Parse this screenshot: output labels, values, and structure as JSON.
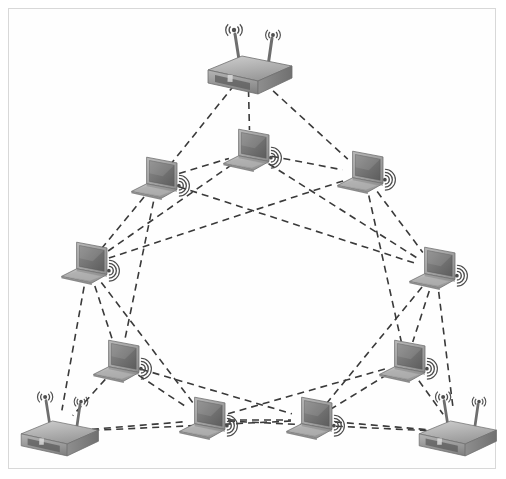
{
  "figure": {
    "width": 506,
    "height": 479,
    "background_color": "#ffffff",
    "border_color": "#d8d8d8",
    "link_color": "#3a3a3a",
    "link_style": "dashed",
    "link_dash": "7,5",
    "link_width": 1.6
  },
  "nodes": [
    {
      "id": "router-top",
      "type": "router",
      "label": "wireless-router",
      "x": 248,
      "y": 68,
      "scale": 1.0,
      "antennas": 2,
      "signal_icon": false
    },
    {
      "id": "laptop-upper-left",
      "type": "laptop",
      "label": "laptop",
      "x": 158,
      "y": 180,
      "scale": 0.95,
      "antennas": 0,
      "signal_icon": true
    },
    {
      "id": "laptop-upper-center",
      "type": "laptop",
      "label": "laptop",
      "x": 250,
      "y": 152,
      "scale": 0.95,
      "antennas": 0,
      "signal_icon": true
    },
    {
      "id": "laptop-upper-right",
      "type": "laptop",
      "label": "laptop",
      "x": 364,
      "y": 174,
      "scale": 0.95,
      "antennas": 0,
      "signal_icon": true
    },
    {
      "id": "laptop-left",
      "type": "laptop",
      "label": "laptop",
      "x": 88,
      "y": 265,
      "scale": 0.95,
      "antennas": 0,
      "signal_icon": true
    },
    {
      "id": "laptop-right",
      "type": "laptop",
      "label": "laptop",
      "x": 436,
      "y": 270,
      "scale": 0.95,
      "antennas": 0,
      "signal_icon": true
    },
    {
      "id": "laptop-lower-left",
      "type": "laptop",
      "label": "laptop",
      "x": 120,
      "y": 363,
      "scale": 0.95,
      "antennas": 0,
      "signal_icon": true
    },
    {
      "id": "laptop-lower-right",
      "type": "laptop",
      "label": "laptop",
      "x": 406,
      "y": 363,
      "scale": 0.95,
      "antennas": 0,
      "signal_icon": true
    },
    {
      "id": "laptop-bottom-left",
      "type": "laptop",
      "label": "laptop",
      "x": 206,
      "y": 420,
      "scale": 0.95,
      "antennas": 0,
      "signal_icon": true
    },
    {
      "id": "laptop-bottom-right",
      "type": "laptop",
      "label": "laptop",
      "x": 313,
      "y": 420,
      "scale": 0.95,
      "antennas": 0,
      "signal_icon": true
    },
    {
      "id": "router-bottom-left",
      "type": "router",
      "label": "wireless-router",
      "x": 58,
      "y": 432,
      "scale": 0.92,
      "antennas": 2,
      "signal_icon": false
    },
    {
      "id": "router-bottom-right",
      "type": "router",
      "label": "wireless-router",
      "x": 456,
      "y": 432,
      "scale": 0.92,
      "antennas": 2,
      "signal_icon": false
    }
  ],
  "links": [
    {
      "from": "router-top",
      "to": "laptop-upper-left"
    },
    {
      "from": "router-top",
      "to": "laptop-upper-center"
    },
    {
      "from": "router-top",
      "to": "laptop-upper-right"
    },
    {
      "from": "laptop-upper-left",
      "to": "laptop-upper-center"
    },
    {
      "from": "laptop-upper-center",
      "to": "laptop-upper-right"
    },
    {
      "from": "laptop-upper-left",
      "to": "laptop-left"
    },
    {
      "from": "laptop-upper-right",
      "to": "laptop-right"
    },
    {
      "from": "laptop-left",
      "to": "laptop-lower-left"
    },
    {
      "from": "laptop-right",
      "to": "laptop-lower-right"
    },
    {
      "from": "laptop-lower-left",
      "to": "router-bottom-left"
    },
    {
      "from": "laptop-lower-right",
      "to": "router-bottom-right"
    },
    {
      "from": "router-bottom-left",
      "to": "laptop-bottom-left"
    },
    {
      "from": "laptop-bottom-left",
      "to": "laptop-bottom-right"
    },
    {
      "from": "laptop-bottom-right",
      "to": "router-bottom-right"
    },
    {
      "from": "laptop-upper-left",
      "to": "laptop-lower-left"
    },
    {
      "from": "laptop-upper-center",
      "to": "laptop-left"
    },
    {
      "from": "laptop-upper-center",
      "to": "laptop-right"
    },
    {
      "from": "laptop-upper-right",
      "to": "laptop-lower-right"
    },
    {
      "from": "laptop-left",
      "to": "laptop-bottom-left"
    },
    {
      "from": "laptop-right",
      "to": "laptop-bottom-right"
    },
    {
      "from": "laptop-lower-left",
      "to": "laptop-bottom-left"
    },
    {
      "from": "laptop-lower-left",
      "to": "laptop-bottom-right"
    },
    {
      "from": "laptop-lower-right",
      "to": "laptop-bottom-right"
    },
    {
      "from": "laptop-lower-right",
      "to": "laptop-bottom-left"
    },
    {
      "from": "laptop-left",
      "to": "router-bottom-left"
    },
    {
      "from": "laptop-right",
      "to": "router-bottom-right"
    },
    {
      "from": "laptop-bottom-left",
      "to": "router-bottom-right"
    },
    {
      "from": "laptop-bottom-right",
      "to": "router-bottom-left"
    },
    {
      "from": "laptop-upper-left",
      "to": "laptop-right"
    },
    {
      "from": "laptop-upper-right",
      "to": "laptop-left"
    }
  ]
}
